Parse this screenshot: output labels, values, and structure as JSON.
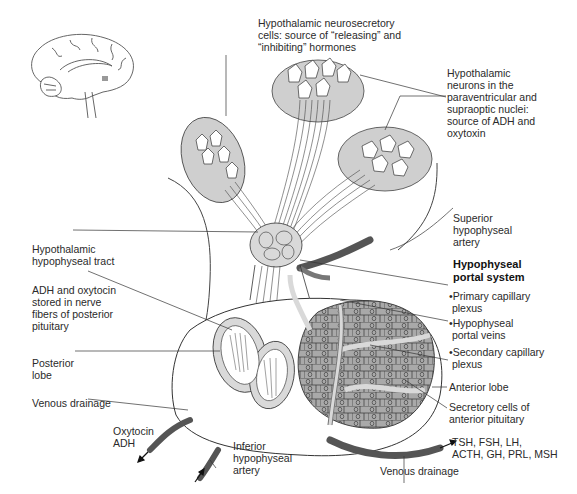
{
  "diagram": {
    "colors": {
      "background": "#ffffff",
      "nucleus_fill": "#cfcfcf",
      "vessel_fill": "#d9d9d9",
      "anterior_cells": "#a9a9a9",
      "artery_dark": "#5a5a5a",
      "line": "#333333"
    },
    "labels": {
      "neurosecretory": "Hypothalamic neurosecretory\ncells: source of “releasing” and\n“inhibiting” hormones",
      "neurons": "Hypothalamic\nneurons in the\nparaventricular and\nsupraoptic nuclei:\nsource of ADH and\noxytoxin",
      "superior_artery": "Superior\nhypophyseal\nartery",
      "portal_system": "Hypophyseal\nportal system",
      "primary_plexus": "•Primary capillary\n plexus",
      "portal_veins": "•Hypophyseal\n portal veins",
      "secondary_plexus": "•Secondary capillary\n plexus",
      "anterior_lobe": "Anterior lobe",
      "secretory_cells": "Secretory cells of\nanterior pituitary",
      "tract": "Hypothalamic\nhypophyseal tract",
      "adh_stored": "ADH and oxytocin\nstored in nerve\nfibers of posterior\npituitary",
      "posterior_lobe": "Posterior\nlobe",
      "venous_left": "Venous drainage",
      "oxytocin_adh": "Oxytocin\nADH",
      "inferior_artery": "Inferior\nhypophyseal\nartery",
      "anterior_hormones": "TSH, FSH, LH,\nACTH, GH, PRL, MSH",
      "venous_bottom": "Venous drainage"
    }
  }
}
